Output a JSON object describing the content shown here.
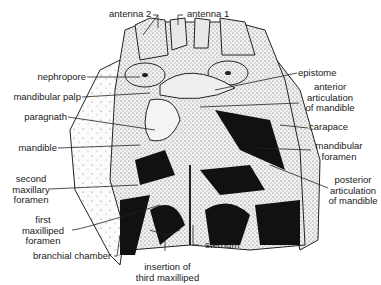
{
  "diagram": {
    "labels": {
      "antenna2": "antenna 2",
      "antenna1": "antenna 1",
      "nephropore": "nephropore",
      "mandibular_palp": "mandibular palp",
      "paragnath": "paragnath",
      "mandible": "mandible",
      "second_maxillary_foramen": [
        "second",
        "maxillary",
        "foramen"
      ],
      "first_maxilliped_foramen": [
        "first",
        "maxilliped",
        "foramen"
      ],
      "branchial_chamber": "branchial chamber",
      "insertion_third_maxilliped": [
        "insertion of",
        "third maxilliped"
      ],
      "sternum": "sternum",
      "epistome": "epistome",
      "anterior_articulation": [
        "anterior",
        "articulation",
        "of mandible"
      ],
      "carapace": "carapace",
      "mandibular_foramen": [
        "mandibular",
        "foramen"
      ],
      "posterior_articulation": [
        "posterior",
        "articulation",
        "of mandible"
      ]
    }
  }
}
